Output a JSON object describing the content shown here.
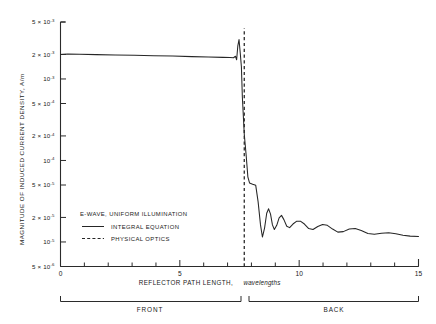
{
  "chart_data": {
    "type": "line",
    "title": "",
    "xlabel": "REFLECTOR PATH LENGTH, wavelengths",
    "ylabel": "MAGNITUDE OF INDUCED CURRENT DENSITY, A/m",
    "xlim": [
      0,
      15
    ],
    "ylim": [
      5e-06,
      0.005
    ],
    "yscale": "log",
    "grid": false,
    "xticks": [
      0,
      5,
      10,
      15
    ],
    "xtick_labels": [
      "0",
      "5",
      "10",
      "15"
    ],
    "xminor_ticks": [
      1,
      2,
      3,
      4,
      6,
      7,
      8,
      9,
      11,
      12,
      13,
      14
    ],
    "yticks": [
      0.005,
      0.002,
      0.001,
      0.0005,
      0.0002,
      0.0001,
      5e-05,
      2e-05,
      1e-05,
      5e-06
    ],
    "ytick_labels": [
      {
        "mant": "5 × 10",
        "exp": "-3"
      },
      {
        "mant": "2 × 10",
        "exp": "-3"
      },
      {
        "mant": "10",
        "exp": "-3"
      },
      {
        "mant": "5 × 10",
        "exp": "-4"
      },
      {
        "mant": "2 × 10",
        "exp": "-4"
      },
      {
        "mant": "10",
        "exp": "-4"
      },
      {
        "mant": "5 × 10",
        "exp": "-5"
      },
      {
        "mant": "2 × 10",
        "exp": "-5"
      },
      {
        "mant": "10",
        "exp": "-5"
      },
      {
        "mant": "5 × 10",
        "exp": "-6"
      }
    ],
    "legend_position": "inside-lower-left",
    "legend_title": "E-WAVE, UNIFORM ILLUMINATION",
    "annotations": [
      {
        "label": "FRONT",
        "x_range": [
          0,
          7.7
        ]
      },
      {
        "label": "BACK",
        "x_range": [
          7.7,
          15
        ]
      },
      {
        "label": "shadow-boundary",
        "x": 7.7
      }
    ],
    "series": [
      {
        "name": "INTEGRAL EQUATION",
        "style": "solid",
        "color": "#262626",
        "points": [
          [
            0.0,
            0.002
          ],
          [
            0.3,
            0.00202
          ],
          [
            0.8,
            0.00201
          ],
          [
            1.5,
            0.00199
          ],
          [
            2.3,
            0.00197
          ],
          [
            3.1,
            0.00195
          ],
          [
            3.9,
            0.00193
          ],
          [
            4.7,
            0.00191
          ],
          [
            5.5,
            0.00188
          ],
          [
            6.2,
            0.00186
          ],
          [
            6.8,
            0.00184
          ],
          [
            7.1,
            0.00183
          ],
          [
            7.25,
            0.00182
          ],
          [
            7.33,
            0.0019
          ],
          [
            7.38,
            0.00172
          ],
          [
            7.43,
            0.00255
          ],
          [
            7.48,
            0.00305
          ],
          [
            7.53,
            0.0021
          ],
          [
            7.58,
            0.0014
          ],
          [
            7.62,
            0.0006
          ],
          [
            7.7,
            0.00021
          ],
          [
            7.78,
            0.000115
          ],
          [
            7.85,
            6.3e-05
          ],
          [
            7.92,
            5.3e-05
          ],
          [
            8.05,
            5.1e-05
          ],
          [
            8.18,
            4.95e-05
          ],
          [
            8.28,
            3.1e-05
          ],
          [
            8.38,
            1.62e-05
          ],
          [
            8.46,
            1.15e-05
          ],
          [
            8.55,
            1.48e-05
          ],
          [
            8.64,
            2.25e-05
          ],
          [
            8.72,
            2.55e-05
          ],
          [
            8.8,
            2.2e-05
          ],
          [
            8.88,
            1.62e-05
          ],
          [
            8.96,
            1.42e-05
          ],
          [
            9.06,
            1.6e-05
          ],
          [
            9.16,
            1.98e-05
          ],
          [
            9.26,
            2.12e-05
          ],
          [
            9.36,
            1.88e-05
          ],
          [
            9.48,
            1.56e-05
          ],
          [
            9.6,
            1.5e-05
          ],
          [
            9.74,
            1.66e-05
          ],
          [
            9.9,
            1.8e-05
          ],
          [
            10.05,
            1.8e-05
          ],
          [
            10.22,
            1.66e-05
          ],
          [
            10.4,
            1.46e-05
          ],
          [
            10.58,
            1.42e-05
          ],
          [
            10.78,
            1.55e-05
          ],
          [
            10.98,
            1.64e-05
          ],
          [
            11.18,
            1.6e-05
          ],
          [
            11.4,
            1.44e-05
          ],
          [
            11.62,
            1.32e-05
          ],
          [
            11.85,
            1.34e-05
          ],
          [
            12.1,
            1.44e-05
          ],
          [
            12.35,
            1.46e-05
          ],
          [
            12.6,
            1.38e-05
          ],
          [
            12.88,
            1.27e-05
          ],
          [
            13.15,
            1.24e-05
          ],
          [
            13.45,
            1.28e-05
          ],
          [
            13.75,
            1.3e-05
          ],
          [
            14.05,
            1.26e-05
          ],
          [
            14.35,
            1.21e-05
          ],
          [
            14.65,
            1.18e-05
          ],
          [
            15.0,
            1.17e-05
          ]
        ]
      },
      {
        "name": "PHYSICAL OPTICS",
        "style": "dashed",
        "color": "#2b2b2b",
        "description": "vertical dashed line at shadow boundary",
        "points": [
          [
            7.7,
            5e-06
          ],
          [
            7.7,
            0.0042
          ]
        ]
      }
    ]
  },
  "axes": {
    "x_title": "REFLECTOR PATH LENGTH,",
    "x_title_italic": "wavelengths",
    "y_title": "MAGNITUDE OF INDUCED CURRENT DENSITY, A/m"
  },
  "legend": {
    "title": "E-WAVE, UNIFORM ILLUMINATION",
    "items": [
      {
        "label": "INTEGRAL EQUATION",
        "style": "solid"
      },
      {
        "label": "PHYSICAL OPTICS",
        "style": "dashed"
      }
    ]
  },
  "regions": [
    {
      "label": "FRONT"
    },
    {
      "label": "BACK"
    }
  ],
  "colors": {
    "ink": "#262626",
    "background": "#ffffff"
  }
}
